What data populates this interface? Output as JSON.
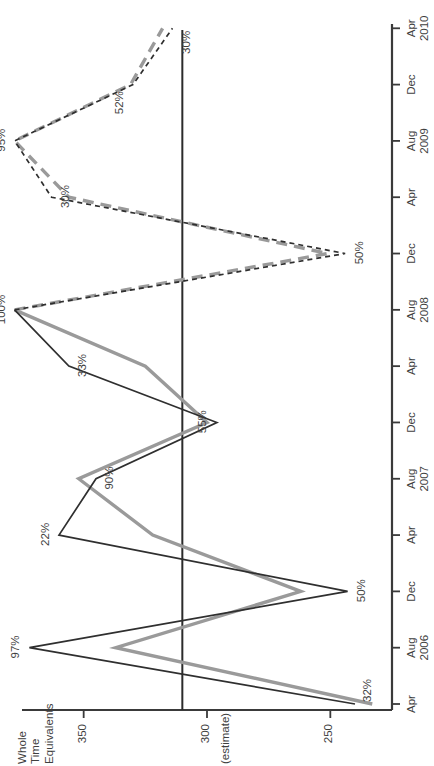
{
  "chart_data": {
    "type": "line",
    "title": "",
    "xlabel": "",
    "ylabel": "Whole Time Equivalents",
    "ylabel_lines": [
      "Whole",
      "Time",
      "Equivalents"
    ],
    "estimate_note": "(estimate)",
    "ylim": [
      225,
      375
    ],
    "yticks": [
      350,
      300,
      250
    ],
    "ytick_labels": [
      "350",
      "300",
      "250"
    ],
    "grid": false,
    "legend": "none",
    "x": [
      "Apr",
      "Aug 2006",
      "Dec",
      "Apr",
      "Aug 2007",
      "Dec",
      "Apr",
      "Aug 2008",
      "Dec",
      "Apr",
      "Aug 2009",
      "Dec",
      "Apr 2010"
    ],
    "xtick_labels": [
      [
        "Apr",
        ""
      ],
      [
        "Aug",
        "2006"
      ],
      [
        "Dec",
        ""
      ],
      [
        "Apr",
        ""
      ],
      [
        "Aug",
        "2007"
      ],
      [
        "Dec",
        ""
      ],
      [
        "Apr",
        ""
      ],
      [
        "Aug",
        "2008"
      ],
      [
        "Dec",
        ""
      ],
      [
        "Apr",
        ""
      ],
      [
        "Aug",
        "2009"
      ],
      [
        "Dec",
        ""
      ],
      [
        "Apr",
        "2010"
      ]
    ],
    "reference_line": {
      "label": "",
      "at_value": 310,
      "orientation": "horizontal-in-source"
    },
    "series": [
      {
        "name": "series-dark",
        "color": "#2f2f2f",
        "style_solid_until_index": 7,
        "style_dashed_from_index": 7,
        "values": [
          240,
          372,
          243,
          360,
          345,
          296,
          356,
          378,
          244,
          363,
          378,
          330,
          314
        ]
      },
      {
        "name": "series-grey",
        "color": "#9a9a9a",
        "style_solid_until_index": 7,
        "style_dashed_from_index": 7,
        "values": [
          233,
          337,
          262,
          322,
          352,
          300,
          325,
          378,
          251,
          356,
          378,
          331,
          318
        ]
      }
    ],
    "point_labels": [
      {
        "text": "32%",
        "series": "series-dark",
        "index": 0
      },
      {
        "text": "97%",
        "series": "series-dark",
        "index": 1
      },
      {
        "text": "50%",
        "series": "series-dark",
        "index": 2
      },
      {
        "text": "22%",
        "series": "series-dark",
        "index": 3
      },
      {
        "text": "90%",
        "series": "series-dark",
        "index": 4
      },
      {
        "text": "55%",
        "series": "series-dark",
        "index": 5
      },
      {
        "text": "33%",
        "series": "series-dark",
        "index": 6
      },
      {
        "text": "100%",
        "series": "series-dark",
        "index": 7
      },
      {
        "text": "50%",
        "series": "series-dark",
        "index": 8
      },
      {
        "text": "30%",
        "series": "series-dark",
        "index": 9
      },
      {
        "text": "95%",
        "series": "series-dark",
        "index": 10
      },
      {
        "text": "52%",
        "series": "series-dark",
        "index": 11
      },
      {
        "text": "30%",
        "series": "series-dark",
        "index": 12
      }
    ],
    "colors": {
      "series_dark": "#2f2f2f",
      "series_grey": "#9a9a9a",
      "axis": "#3a3a3a",
      "text": "#3f3f3f",
      "background": "#ffffff"
    }
  }
}
